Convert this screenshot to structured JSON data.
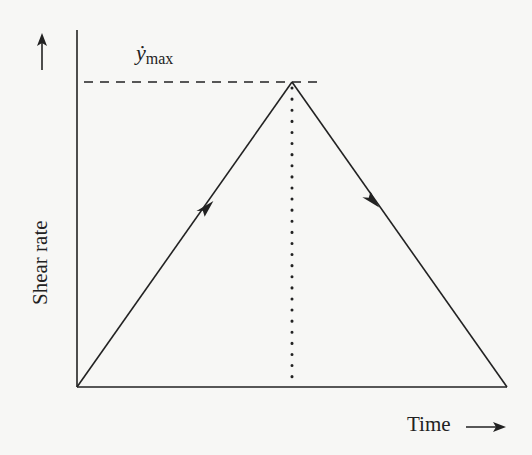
{
  "diagram": {
    "y_axis_label": "Shear rate",
    "x_axis_label": "Time",
    "peak_symbol": "ẏ",
    "peak_subscript": "max",
    "elements": [
      {
        "type": "axis",
        "name": "y-axis",
        "arrow": "up"
      },
      {
        "type": "axis",
        "name": "x-axis",
        "arrow": "right"
      },
      {
        "type": "line",
        "name": "ramp-up",
        "from": [
          0,
          0
        ],
        "to": [
          0.5,
          1
        ],
        "arrow": "mid"
      },
      {
        "type": "line",
        "name": "ramp-down",
        "from": [
          0.5,
          1
        ],
        "to": [
          1,
          0
        ],
        "arrow": "mid"
      },
      {
        "type": "dashed-line",
        "name": "max-level",
        "level": "ẏmax"
      },
      {
        "type": "dotted-line",
        "name": "peak-time-marker"
      }
    ]
  },
  "colors": {
    "ink": "#222222",
    "background": "#f7f7f5"
  }
}
